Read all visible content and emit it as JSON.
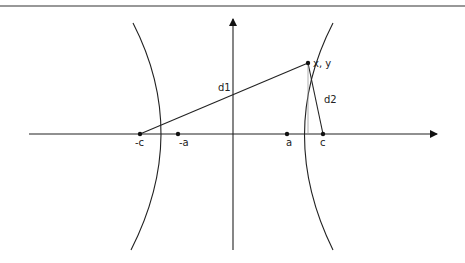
{
  "diagram": {
    "type": "hyperbola-foci-distances",
    "labels": {
      "neg_c": "-c",
      "neg_a": "-a",
      "a": "a",
      "c": "c",
      "point": "x, y",
      "d1": "d1",
      "d2": "d2"
    },
    "colors": {
      "stroke": "#222222",
      "helper_line": "#999999",
      "background": "#ffffff"
    }
  }
}
